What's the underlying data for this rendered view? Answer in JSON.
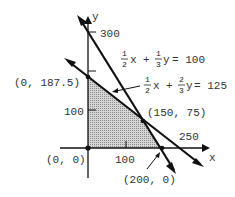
{
  "diagram": {
    "axes": {
      "x_label": "x",
      "y_label": "y",
      "x_ticks": [
        "100",
        "250"
      ],
      "y_ticks": [
        "100",
        "300"
      ]
    },
    "constraints": [
      {
        "id": "line1",
        "equation": "1/2 x + 1/3 y = 100",
        "coef_x": {
          "num": "1",
          "den": "2"
        },
        "coef_y": {
          "num": "1",
          "den": "3"
        },
        "x_var": "x",
        "y_var": "y",
        "rhs": "= 100"
      },
      {
        "id": "line2",
        "equation": "1/2 x + 2/3 y = 125",
        "coef_x": {
          "num": "1",
          "den": "2"
        },
        "coef_y": {
          "num": "2",
          "den": "3"
        },
        "x_var": "x",
        "y_var": "y",
        "rhs": "= 125"
      }
    ],
    "vertices": [
      {
        "label": "(0, 0)"
      },
      {
        "label": "(0, 187.5)"
      },
      {
        "label": "(150, 75)"
      },
      {
        "label": "(200, 0)"
      }
    ],
    "plus": "+",
    "colors": {
      "line": "#111111",
      "region_fill": "#bdbdbd",
      "text": "#333333"
    }
  }
}
